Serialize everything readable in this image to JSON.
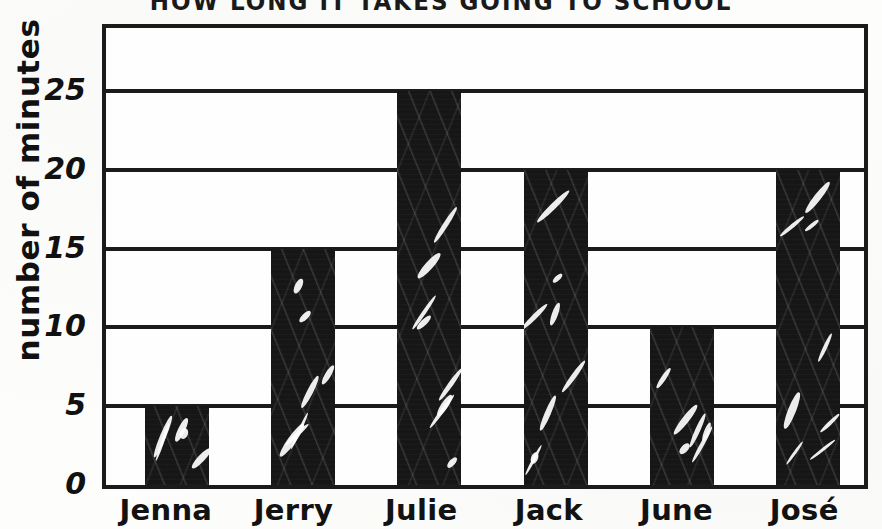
{
  "chart_data": {
    "type": "bar",
    "title": "HOW LONG IT TAKES GOING TO SCHOOL",
    "xlabel": "",
    "ylabel": "number of minutes",
    "categories": [
      "Jenna",
      "Jerry",
      "Julie",
      "Jack",
      "June",
      "José"
    ],
    "values": [
      5,
      15,
      25,
      20,
      10,
      20
    ],
    "ylim": [
      0,
      29
    ],
    "yticks": [
      0,
      5,
      10,
      15,
      20,
      25
    ],
    "ytick_labels": [
      "0",
      "5",
      "10",
      "15",
      "20",
      "25"
    ],
    "grid": true,
    "gridlines": "horizontal",
    "legend": "none",
    "bar_color": "#161616",
    "axis_color": "#1b1b1b",
    "background_color": "#fdfdfb",
    "annotations": []
  },
  "axis": {
    "y_title": "number of minutes"
  },
  "bars": [
    {
      "label": "Jenna",
      "value": 5,
      "value_text": "5"
    },
    {
      "label": "Jerry",
      "value": 15,
      "value_text": "15"
    },
    {
      "label": "Julie",
      "value": 25,
      "value_text": "25"
    },
    {
      "label": "Jack",
      "value": 20,
      "value_text": "20"
    },
    {
      "label": "June",
      "value": 10,
      "value_text": "10"
    },
    {
      "label": "José",
      "value": 20,
      "value_text": "20"
    }
  ],
  "ticks": [
    {
      "label": "25"
    },
    {
      "label": "20"
    },
    {
      "label": "15"
    },
    {
      "label": "10"
    },
    {
      "label": "5"
    },
    {
      "label": "0"
    }
  ]
}
